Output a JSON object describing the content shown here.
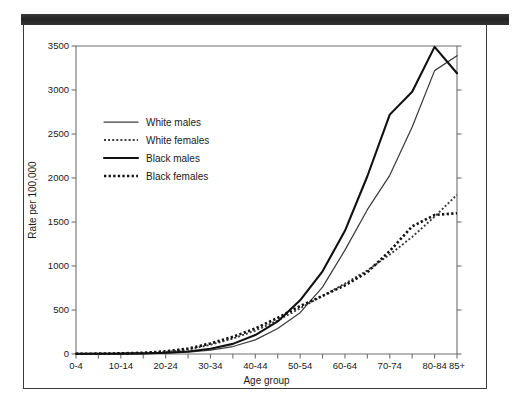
{
  "figure": {
    "scan_bar": true,
    "frame": true
  },
  "chart_data": {
    "type": "line",
    "title": "",
    "xlabel": "Age group",
    "ylabel": "Rate per 100,000",
    "ylim": [
      0,
      3500
    ],
    "yticks": [
      0,
      500,
      1000,
      1500,
      2000,
      2500,
      3000,
      3500
    ],
    "ytick_labels": [
      "0",
      "500",
      "1000",
      "1500",
      "2000",
      "2500",
      "3000",
      "3500"
    ],
    "grid": false,
    "legend_position": "upper left",
    "categories": [
      "0-4",
      "5-9",
      "10-14",
      "15-19",
      "20-24",
      "25-29",
      "30-34",
      "35-39",
      "40-44",
      "45-49",
      "50-54",
      "55-59",
      "60-64",
      "65-69",
      "70-74",
      "75-79",
      "80-84",
      "85+"
    ],
    "xtick_labels": [
      "0-4",
      "10-14",
      "20-24",
      "30-34",
      "40-44",
      "50-54",
      "60-64",
      "70-74",
      "80-84",
      "85+"
    ],
    "xtick_label_indices": [
      0,
      2,
      4,
      6,
      8,
      10,
      12,
      14,
      16,
      17
    ],
    "series": [
      {
        "name": "White males",
        "style": "solid-thin",
        "color": "#3d3d3d",
        "values": [
          2,
          2,
          3,
          5,
          10,
          20,
          45,
          85,
          160,
          290,
          470,
          760,
          1180,
          1640,
          2030,
          2580,
          3220,
          3390
        ]
      },
      {
        "name": "White females",
        "style": "dotted-thin",
        "color": "#3d3d3d",
        "values": [
          2,
          3,
          5,
          10,
          22,
          50,
          105,
          175,
          265,
          380,
          520,
          660,
          800,
          950,
          1130,
          1330,
          1560,
          1810
        ]
      },
      {
        "name": "Black males",
        "style": "solid-thick",
        "color": "#111111",
        "values": [
          3,
          3,
          4,
          7,
          14,
          28,
          60,
          115,
          215,
          370,
          610,
          940,
          1400,
          2020,
          2720,
          2980,
          3490,
          3190
        ]
      },
      {
        "name": "Black females",
        "style": "dotted-thick",
        "color": "#111111",
        "values": [
          3,
          4,
          7,
          14,
          30,
          62,
          120,
          195,
          290,
          410,
          545,
          660,
          780,
          930,
          1170,
          1450,
          1580,
          1600
        ]
      }
    ]
  }
}
